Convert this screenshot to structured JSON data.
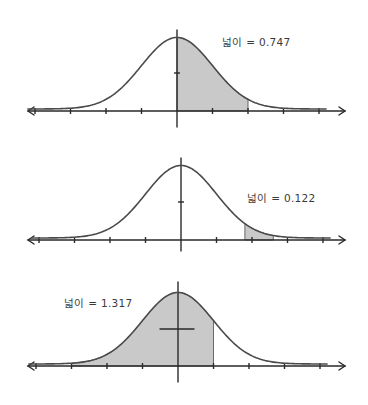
{
  "figure": {
    "panels": [
      {
        "label": "넓이 = 0.747",
        "shade_from": 0,
        "shade_to": 2
      },
      {
        "label": "넓이 = 0.122",
        "shade_from": 1.8,
        "shade_to": 2.6
      },
      {
        "label": "넓이 = 1.317",
        "shade_from": -3,
        "shade_to": 1
      }
    ]
  },
  "chart_data": [
    {
      "type": "area",
      "title": "",
      "annotation": "넓이 = 0.747",
      "x_ticks": [
        -4,
        -3,
        -2,
        -1,
        0,
        1,
        2,
        3,
        4
      ],
      "shaded_interval": [
        0,
        2
      ],
      "area_label_value": 0.747,
      "grid": false
    },
    {
      "type": "area",
      "title": "",
      "annotation": "넓이 = 0.122",
      "x_ticks": [
        -4,
        -3,
        -2,
        -1,
        0,
        1,
        2,
        3,
        4
      ],
      "shaded_interval": [
        1.8,
        2.6
      ],
      "area_label_value": 0.122,
      "grid": false
    },
    {
      "type": "area",
      "title": "",
      "annotation": "넓이 = 1.317",
      "x_ticks": [
        -4,
        -3,
        -2,
        -1,
        0,
        1,
        2,
        3,
        4
      ],
      "shaded_interval": [
        -3,
        1
      ],
      "area_label_value": 1.317,
      "grid": false
    }
  ]
}
